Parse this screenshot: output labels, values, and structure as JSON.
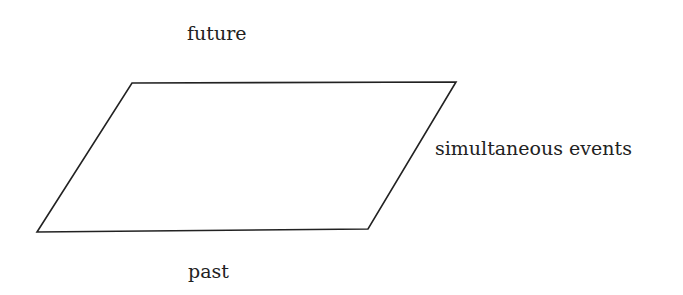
{
  "diagram": {
    "labels": {
      "future": "future",
      "past": "past",
      "simultaneous": "simultaneous events"
    },
    "shape": {
      "type": "parallelogram",
      "stroke": "#222222",
      "points": "132,83 456,82 368,229 37,232"
    }
  }
}
